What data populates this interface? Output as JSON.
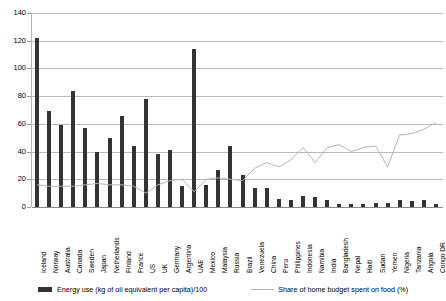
{
  "chart_data": {
    "type": "bar",
    "title": "",
    "xlabel": "",
    "ylabel": "",
    "ylim": [
      0,
      140
    ],
    "yticks": [
      0,
      20,
      40,
      60,
      80,
      100,
      120,
      140
    ],
    "grid": true,
    "legend_position": "bottom",
    "categories": [
      "Iceland",
      "Norway",
      "Australia",
      "Canada",
      "Sweden",
      "Japan",
      "Netherlands",
      "Finland",
      "France",
      "US",
      "UK",
      "Germany",
      "Argentina",
      "UAE",
      "Mexico",
      "Malaysia",
      "Russia",
      "Brazil",
      "Venezuela",
      "China",
      "Peru",
      "Philippines",
      "Indonesia",
      "Namibia",
      "India",
      "Bangladesh",
      "Nepal",
      "Haiti",
      "Sudan",
      "Yemen",
      "Nigeria",
      "Tanzania",
      "Angola",
      "Congo DR"
    ],
    "series": [
      {
        "name": "Energy use (kg of oil equivalent per capita)/100",
        "type": "bar",
        "color": "#333333",
        "values": [
          122,
          69,
          59,
          84,
          57,
          40,
          50,
          66,
          44,
          78,
          38,
          41,
          15,
          114,
          16,
          27,
          44,
          23,
          14,
          14,
          6,
          5,
          8,
          7,
          5,
          2,
          2,
          2,
          3,
          3,
          5,
          4,
          5,
          2
        ]
      },
      {
        "name": "Share of home budget spent on food (%)",
        "type": "line",
        "color": "#b4b4b4",
        "values": [
          16,
          15,
          15,
          15,
          16,
          17,
          16,
          16,
          15,
          10,
          16,
          19,
          20,
          11,
          20,
          21,
          20,
          19,
          28,
          32,
          29,
          34,
          43,
          32,
          43,
          45,
          40,
          43,
          44,
          29,
          52,
          53,
          56,
          61
        ]
      }
    ]
  },
  "legend": {
    "bars_label": "Energy use (kg of oil equivalent per capita)/100",
    "line_label": "Share of home budget spent on food (%)"
  }
}
